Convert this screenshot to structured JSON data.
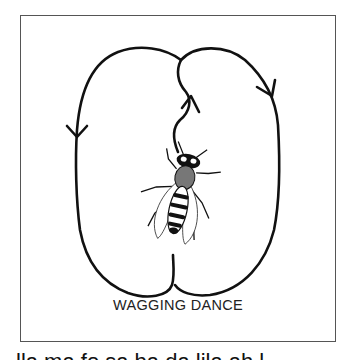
{
  "figure": {
    "caption": "WAGGING DANCE",
    "elements": [
      "left-loop-with-arrow",
      "right-loop-with-arrow",
      "waggle-run-path-with-arrow",
      "bee-illustration"
    ],
    "line_color": "#111111",
    "frame_color": "#555555"
  },
  "below_frame": {
    "cutoff_text": "lla ma fo sa ba da lila ah l"
  }
}
